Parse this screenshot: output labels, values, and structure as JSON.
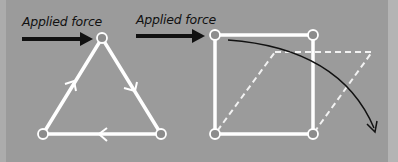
{
  "diagram": {
    "panels": [
      {
        "name": "triangle-frame",
        "label": "Applied force",
        "shape": "triangle",
        "nodes": [
          [
            102,
            38
          ],
          [
            43,
            134
          ],
          [
            161,
            134
          ]
        ],
        "edge_direction_arrows": [
          "up-left-edge",
          "down-right-edge",
          "leftward-bottom-edge"
        ]
      },
      {
        "name": "square-frame",
        "label": "Applied force",
        "shape": "square",
        "nodes": [
          [
            215,
            35
          ],
          [
            313,
            35
          ],
          [
            215,
            134
          ],
          [
            313,
            134
          ]
        ],
        "deformed_shape": "dashed parallelogram",
        "deformation_arrow": "curved arrow showing square collapsing"
      }
    ],
    "colors": {
      "background": "#9b9b9b",
      "frame": "#ffffff",
      "node_fill": "#8c8c8c",
      "arrow": "#111111"
    }
  }
}
